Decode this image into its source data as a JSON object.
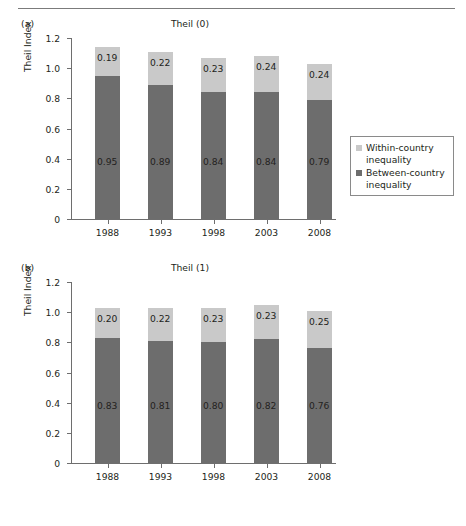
{
  "figure": {
    "axis_label_y": "Theil Index",
    "categories": [
      "1988",
      "1993",
      "1998",
      "2003",
      "2008"
    ],
    "y_ticks": [
      "0",
      "0.2",
      "0.4",
      "0.6",
      "0.8",
      "1.0",
      "1.2"
    ],
    "colors": {
      "within": "#c9c9c9",
      "between": "#6d6d6d",
      "axis": "#6e6e6e",
      "text": "#231f20",
      "rule": "#7b7b7b"
    }
  },
  "legend": {
    "within_label_line1": "Within-country",
    "within_label_line2": "inequality",
    "between_label_line1": "Between-country",
    "between_label_line2": "inequality"
  },
  "panels": {
    "a": {
      "letter": "(a)",
      "title": "Theil (0)"
    },
    "b": {
      "letter": "(b)",
      "title": "Theil (1)"
    }
  },
  "chart_data": [
    {
      "type": "bar",
      "id": "theil-0",
      "panel": "(a)",
      "title": "Theil (0)",
      "stacked": true,
      "xlabel": "",
      "ylabel": "Theil Index",
      "ylim": [
        0,
        1.2
      ],
      "yticks": [
        0,
        0.2,
        0.4,
        0.6,
        0.8,
        1.0,
        1.2
      ],
      "grid": false,
      "legend_position": "right",
      "categories": [
        "1988",
        "1993",
        "1998",
        "2003",
        "2008"
      ],
      "series": [
        {
          "name": "Between-country inequality",
          "color": "#6d6d6d",
          "values": [
            0.95,
            0.89,
            0.84,
            0.84,
            0.79
          ],
          "labels": [
            "0.95",
            "0.89",
            "0.84",
            "0.84",
            "0.79"
          ]
        },
        {
          "name": "Within-country inequality",
          "color": "#c9c9c9",
          "values": [
            0.19,
            0.22,
            0.23,
            0.24,
            0.24
          ],
          "labels": [
            "0.19",
            "0.22",
            "0.23",
            "0.24",
            "0.24"
          ]
        }
      ],
      "totals": [
        1.14,
        1.11,
        1.07,
        1.08,
        1.03
      ]
    },
    {
      "type": "bar",
      "id": "theil-1",
      "panel": "(b)",
      "title": "Theil (1)",
      "stacked": true,
      "xlabel": "",
      "ylabel": "Theil Index",
      "ylim": [
        0,
        1.2
      ],
      "yticks": [
        0,
        0.2,
        0.4,
        0.6,
        0.8,
        1.0,
        1.2
      ],
      "grid": false,
      "legend_position": "right",
      "categories": [
        "1988",
        "1993",
        "1998",
        "2003",
        "2008"
      ],
      "series": [
        {
          "name": "Between-country inequality",
          "color": "#6d6d6d",
          "values": [
            0.83,
            0.81,
            0.8,
            0.82,
            0.76
          ],
          "labels": [
            "0.83",
            "0.81",
            "0.80",
            "0.82",
            "0.76"
          ]
        },
        {
          "name": "Within-country inequality",
          "color": "#c9c9c9",
          "values": [
            0.2,
            0.22,
            0.23,
            0.23,
            0.25
          ],
          "labels": [
            "0.20",
            "0.22",
            "0.23",
            "0.23",
            "0.25"
          ]
        }
      ],
      "totals": [
        1.03,
        1.03,
        1.03,
        1.05,
        1.01
      ]
    }
  ]
}
